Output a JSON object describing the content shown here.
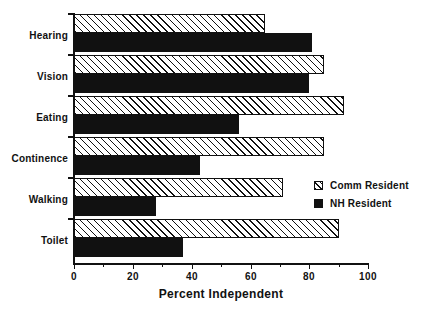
{
  "chart_data": {
    "type": "bar",
    "orientation": "horizontal",
    "title": "",
    "xlabel": "Percent Independent",
    "ylabel": "",
    "xlim": [
      0,
      100
    ],
    "xticks": [
      0,
      20,
      40,
      60,
      80,
      100
    ],
    "xtick_labels": [
      "0",
      "20",
      "40",
      "60",
      "80",
      "100"
    ],
    "grid": false,
    "legend_position": "center-right",
    "categories": [
      "Hearing",
      "Vision",
      "Eating",
      "Continence",
      "Walking",
      "Toilet"
    ],
    "series": [
      {
        "name": "Comm Resident",
        "fill": "hatched",
        "color": "#ffffff",
        "values": [
          65,
          85,
          92,
          85,
          71,
          90
        ]
      },
      {
        "name": "NH Resident",
        "fill": "solid",
        "color": "#111111",
        "values": [
          81,
          80,
          56,
          43,
          28,
          37
        ]
      }
    ]
  },
  "axis": {
    "title": "Percent Independent",
    "tick_labels": [
      "0",
      "20",
      "40",
      "60",
      "80",
      "100"
    ]
  },
  "categories": [
    {
      "label": "Hearing"
    },
    {
      "label": "Vision"
    },
    {
      "label": "Eating"
    },
    {
      "label": "Continence"
    },
    {
      "label": "Walking"
    },
    {
      "label": "Toilet"
    }
  ],
  "legend": {
    "items": [
      {
        "label": "Comm Resident",
        "swatch": "hatched-square-icon"
      },
      {
        "label": "NH Resident",
        "swatch": "filled-square-icon"
      }
    ]
  },
  "colors": {
    "ink": "#111111",
    "background": "#ffffff"
  }
}
